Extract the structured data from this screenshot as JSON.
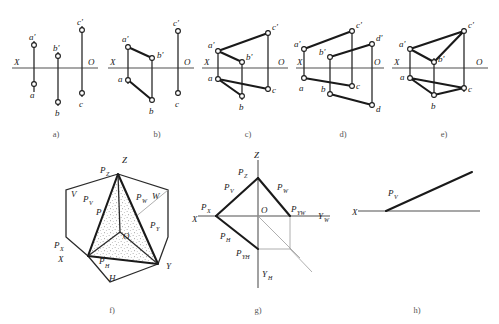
{
  "figure": {
    "axis_color": "#8a8a8a",
    "line_color": "#1a1a1a",
    "background": "#ffffff"
  },
  "panels": [
    {
      "id": "a",
      "caption": "a)",
      "axis_left_label": "X",
      "axis_right_label": "O",
      "points": [
        {
          "name": "a-prime",
          "label": "a'"
        },
        {
          "name": "a",
          "label": "a"
        },
        {
          "name": "b-prime",
          "label": "b'"
        },
        {
          "name": "b",
          "label": "b"
        },
        {
          "name": "c-prime",
          "label": "c'"
        },
        {
          "name": "c",
          "label": "c"
        }
      ]
    },
    {
      "id": "b",
      "caption": "b)",
      "axis_left_label": "X",
      "axis_right_label": "O",
      "points": [
        {
          "name": "a-prime",
          "label": "a'"
        },
        {
          "name": "a",
          "label": "a"
        },
        {
          "name": "b-prime",
          "label": "b'"
        },
        {
          "name": "b",
          "label": "b"
        },
        {
          "name": "c-prime",
          "label": "c'"
        },
        {
          "name": "c",
          "label": "c"
        }
      ]
    },
    {
      "id": "c",
      "caption": "c)",
      "axis_left_label": "X",
      "axis_right_label": "O",
      "points": [
        {
          "name": "a-prime",
          "label": "a'"
        },
        {
          "name": "a",
          "label": "a"
        },
        {
          "name": "b-prime",
          "label": "b'"
        },
        {
          "name": "b",
          "label": "b"
        },
        {
          "name": "c-prime",
          "label": "c'"
        },
        {
          "name": "c",
          "label": "c"
        }
      ]
    },
    {
      "id": "d",
      "caption": "d)",
      "axis_left_label": "X",
      "axis_right_label": "O",
      "points": [
        {
          "name": "a-prime",
          "label": "a'"
        },
        {
          "name": "a",
          "label": "a"
        },
        {
          "name": "b-prime",
          "label": "b'"
        },
        {
          "name": "b",
          "label": "b"
        },
        {
          "name": "c-prime",
          "label": "c'"
        },
        {
          "name": "c",
          "label": "c"
        },
        {
          "name": "d-prime",
          "label": "d'"
        },
        {
          "name": "d",
          "label": "d"
        }
      ]
    },
    {
      "id": "e",
      "caption": "e)",
      "axis_left_label": "X",
      "axis_right_label": "O",
      "points": [
        {
          "name": "a-prime",
          "label": "a'"
        },
        {
          "name": "a",
          "label": "a"
        },
        {
          "name": "b-prime",
          "label": "b'"
        },
        {
          "name": "b",
          "label": "b"
        },
        {
          "name": "c-prime",
          "label": "c'"
        },
        {
          "name": "c",
          "label": "c"
        }
      ]
    },
    {
      "id": "f",
      "caption": "f)",
      "labels": {
        "z": "Z",
        "x": "X",
        "y": "Y",
        "o": "O",
        "v": "V",
        "w": "W",
        "h": "H",
        "p": "P",
        "pz_base": "P",
        "pz_sub": "Z",
        "pv_base": "P",
        "pv_sub": "V",
        "pw_base": "P",
        "pw_sub": "W",
        "px_base": "P",
        "px_sub": "X",
        "py_base": "P",
        "py_sub": "Y",
        "ph_base": "P",
        "ph_sub": "H"
      }
    },
    {
      "id": "g",
      "caption": "g)",
      "labels": {
        "z": "Z",
        "x": "X",
        "o": "O",
        "yw_base": "Y",
        "yw_sub": "W",
        "yh_base": "Y",
        "yh_sub": "H",
        "pz_base": "P",
        "pz_sub": "Z",
        "pv_base": "P",
        "pv_sub": "V",
        "pw_base": "P",
        "pw_sub": "W",
        "px_base": "P",
        "px_sub": "X",
        "ph_base": "P",
        "ph_sub": "H",
        "pyw_base": "P",
        "pyw_sub": "YW",
        "pyh_base": "P",
        "pyh_sub": "YH"
      }
    },
    {
      "id": "h",
      "caption": "h)",
      "labels": {
        "x": "X",
        "pv_base": "P",
        "pv_sub": "V"
      }
    }
  ]
}
